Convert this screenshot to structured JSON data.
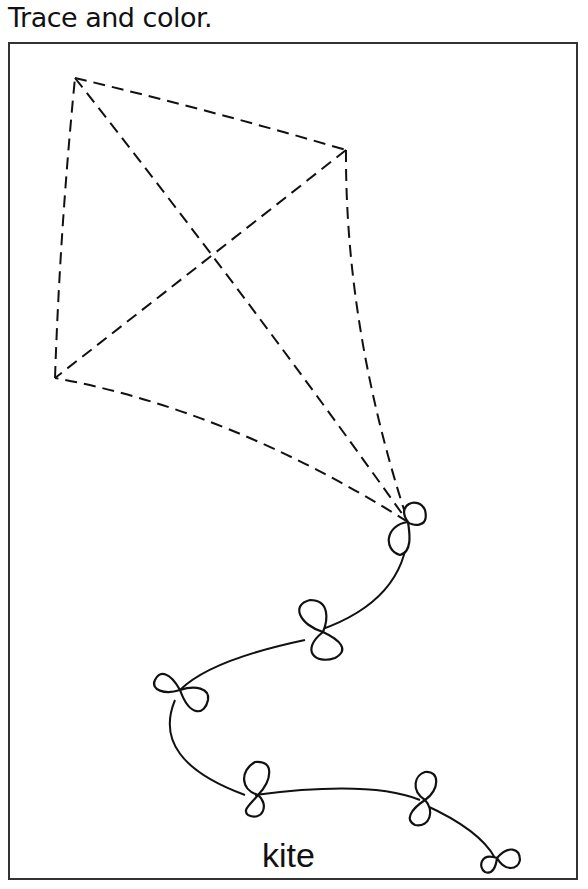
{
  "worksheet": {
    "instruction": "Trace and color.",
    "word_label": "kite",
    "colors": {
      "ink": "#111111",
      "frame": "#333333",
      "background": "#ffffff"
    },
    "illustration": {
      "subject": "kite",
      "kite_outline_style": "dashed",
      "tail_bows_count": 6
    }
  }
}
